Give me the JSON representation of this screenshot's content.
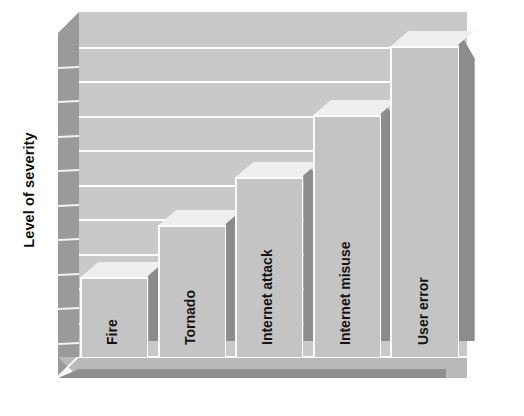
{
  "chart_data": {
    "type": "bar",
    "title": "",
    "subtitle": "",
    "xlabel": "",
    "ylabel": "Level of severity",
    "categories": [
      "Fire",
      "Tornado",
      "Internet attack",
      "Internet misuse",
      "User error"
    ],
    "values": [
      2.3,
      3.8,
      5.2,
      7.0,
      9.0
    ],
    "ylim": [
      0,
      10
    ],
    "y_tick_labels": [],
    "x_tick_labels": [
      "Fire",
      "Tornado",
      "Internet attack",
      "Internet misuse",
      "User error"
    ],
    "grid": true,
    "gridline_count": 9,
    "legend": [],
    "legend_position": "none",
    "annotations": [],
    "style": "3d-column",
    "label_placement": "inside-bar-rotated",
    "label_rotation_degrees": -90,
    "ylabel_rotation_degrees": -90
  },
  "axis": {
    "ylabel": "Level of severity"
  },
  "bars": [
    {
      "label": "Fire",
      "value": 2.3
    },
    {
      "label": "Tornado",
      "value": 3.8
    },
    {
      "label": "Internet attack",
      "value": 5.2
    },
    {
      "label": "Internet misuse",
      "value": 7.0
    },
    {
      "label": "User error",
      "value": 9.0
    }
  ],
  "colors": {
    "back_wall": "#c9c9c9",
    "left_wall": "#9a9a9a",
    "floor": "#b9b9b9",
    "floor_front_edge": "#8f8f8f",
    "gridline": "#fdfdfd",
    "bar_front": "#c4c4c4",
    "bar_side": "#8c8c8c",
    "bar_top": "#efefef",
    "text": "#141414",
    "background": "#ffffff"
  }
}
